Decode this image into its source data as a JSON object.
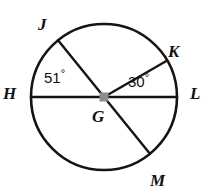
{
  "figure": {
    "type": "circle-diagram",
    "stroke_color": "#141414",
    "background_color": "#ffffff",
    "center_dot_color": "#8c8c8c",
    "circle": {
      "center_label": "G",
      "cx": 104,
      "cy": 97,
      "r": 73,
      "stroke_width": 2.6
    },
    "center_dot": {
      "size": 9,
      "shape": "square"
    },
    "points": [
      {
        "id": "J",
        "label": "J",
        "angle_deg": 129,
        "label_x": 38,
        "label_y": 16
      },
      {
        "id": "K",
        "label": "K",
        "angle_deg": 30,
        "label_x": 168,
        "label_y": 43
      },
      {
        "id": "H",
        "label": "H",
        "angle_deg": 180,
        "label_x": 3,
        "label_y": 85
      },
      {
        "id": "L",
        "label": "L",
        "angle_deg": 0,
        "label_x": 190,
        "label_y": 85
      },
      {
        "id": "M",
        "label": "M",
        "angle_deg": -51,
        "label_x": 150,
        "label_y": 172
      },
      {
        "id": "G",
        "label": "G",
        "angle_deg": null,
        "label_x": 92,
        "label_y": 108
      }
    ],
    "chords": [
      {
        "id": "HL",
        "from": "H",
        "to": "L",
        "kind": "diameter"
      },
      {
        "id": "JM",
        "from": "J",
        "to": "M",
        "kind": "diameter"
      },
      {
        "id": "GK",
        "from": "G",
        "to": "K",
        "kind": "radius"
      }
    ],
    "angles": [
      {
        "id": "HGJ",
        "value": "51",
        "degree_symbol": "°",
        "vertex": "G",
        "rays": [
          "H",
          "J"
        ],
        "label_x": 44,
        "label_y": 68
      },
      {
        "id": "KGL",
        "value": "30",
        "degree_symbol": "°",
        "vertex": "G",
        "rays": [
          "K",
          "L"
        ],
        "label_x": 128,
        "label_y": 72
      }
    ]
  }
}
